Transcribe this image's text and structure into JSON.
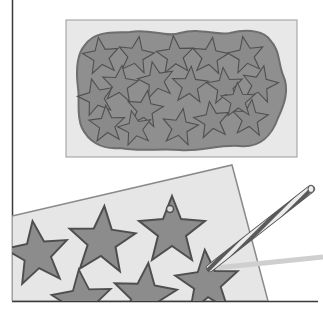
{
  "illustration": {
    "description": "Two-panel instructional illustration: star cookies cut from rolled dough, then a striped straw punching a hole in a star",
    "colors": {
      "background": "#ffffff",
      "paper": "#e6e6e6",
      "paper_edge": "#9a9a9a",
      "dough": "#8f8f8f",
      "dough_edge": "#6e6e6e",
      "star_fill": "#8c8c8c",
      "star_edge": "#555555",
      "frame_line": "#3a3a3a",
      "straw_light": "#e8e8e8",
      "straw_dark": "#555555"
    },
    "top_panel": {
      "star_count": 18
    },
    "bottom_panel": {
      "visible_star_count": 6,
      "star_with_hole_index": 2
    }
  }
}
